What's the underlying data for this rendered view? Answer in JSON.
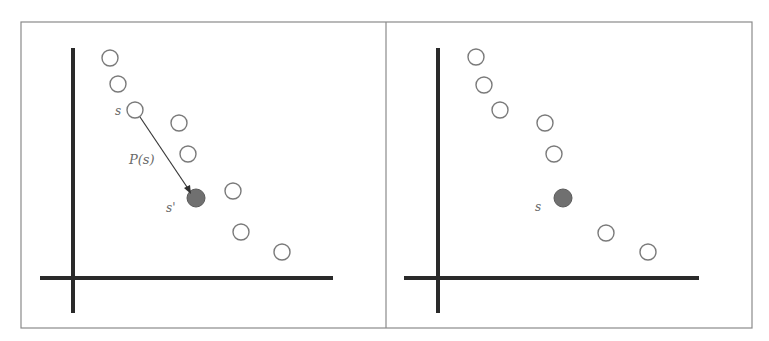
{
  "figure": {
    "colors": {
      "axis": "#2a2a2a",
      "open_point_stroke": "#7a7a7a",
      "filled_point": "#707070",
      "border": "#8a8a8a"
    },
    "panels": [
      {
        "id": "left",
        "labels": {
          "source": "s",
          "projection": "P(s)",
          "target": "s'"
        },
        "open_points": 8,
        "filled_points": 1
      },
      {
        "id": "right",
        "labels": {
          "target": "s"
        },
        "open_points": 7,
        "filled_points": 1
      }
    ]
  }
}
